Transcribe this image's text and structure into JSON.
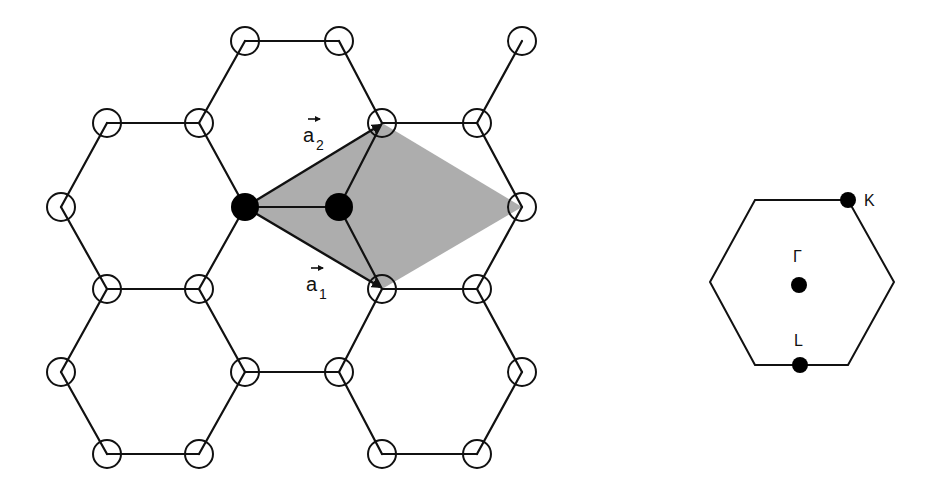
{
  "figure": {
    "left_panel": {
      "title": "Honeycomb lattice (real space)",
      "unit_cell_fill": "#a9a9a9",
      "vectors": [
        {
          "name": "a1",
          "base": "a",
          "subscript": "1"
        },
        {
          "name": "a2",
          "base": "a",
          "subscript": "2"
        }
      ],
      "open_atoms": [
        [
          245,
          41
        ],
        [
          339,
          41
        ],
        [
          522,
          41
        ],
        [
          107,
          123
        ],
        [
          199,
          123
        ],
        [
          382,
          123
        ],
        [
          477,
          123
        ],
        [
          61,
          207
        ],
        [
          522,
          207
        ],
        [
          107,
          289
        ],
        [
          199,
          289
        ],
        [
          382,
          289
        ],
        [
          477,
          289
        ],
        [
          61,
          372
        ],
        [
          245,
          372
        ],
        [
          339,
          372
        ],
        [
          522,
          372
        ],
        [
          107,
          454
        ],
        [
          199,
          454
        ],
        [
          382,
          454
        ],
        [
          477,
          454
        ]
      ],
      "filled_atoms": [
        [
          245,
          207
        ],
        [
          339,
          207
        ]
      ]
    },
    "right_panel": {
      "title": "Brillouin zone",
      "points": [
        {
          "label": "K",
          "x": 848,
          "y": 200
        },
        {
          "label": "Γ",
          "x": 799,
          "y": 285
        },
        {
          "label": "L",
          "x": 800,
          "y": 365
        }
      ]
    }
  }
}
